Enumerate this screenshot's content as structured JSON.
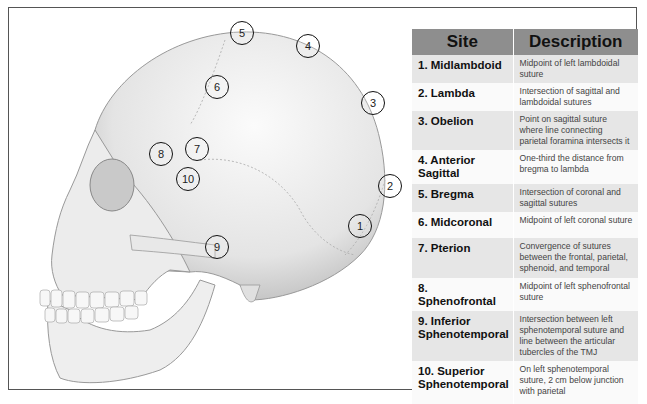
{
  "table": {
    "headers": {
      "site": "Site",
      "description": "Description"
    },
    "rows": [
      {
        "site": "1. Midlambdoid",
        "description": "Midpoint of left lambdoidal suture"
      },
      {
        "site": "2. Lambda",
        "description": "Intersection of sagittal and lambdoidal sutures"
      },
      {
        "site": "3. Obelion",
        "description": "Point on sagittal suture where line connecting parietal foramina intersects it"
      },
      {
        "site": "4. Anterior Sagittal",
        "description": "One-third the distance from bregma to lambda"
      },
      {
        "site": "5. Bregma",
        "description": "Intersection of coronal and sagittal sutures"
      },
      {
        "site": "6. Midcoronal",
        "description": "Midpoint of left coronal suture"
      },
      {
        "site": "7. Pterion",
        "description": "Convergence of sutures between the frontal, parietal, sphenoid, and temporal"
      },
      {
        "site": "8. Sphenofrontal",
        "description": "Midpoint of left sphenofrontal suture"
      },
      {
        "site": "9. Inferior Sphenotemporal",
        "description": "Intersection between left sphenotemporal suture and line between the articular tubercles of the TMJ"
      },
      {
        "site": "10. Superior Sphenotemporal",
        "description": "On left sphenotemporal suture, 2 cm below junction with parietal"
      }
    ]
  },
  "markers": [
    {
      "label": "1",
      "x": 348,
      "y": 214
    },
    {
      "label": "2",
      "x": 378,
      "y": 174
    },
    {
      "label": "3",
      "x": 361,
      "y": 91
    },
    {
      "label": "4",
      "x": 296,
      "y": 34
    },
    {
      "label": "5",
      "x": 230,
      "y": 21
    },
    {
      "label": "6",
      "x": 205,
      "y": 75
    },
    {
      "label": "7",
      "x": 185,
      "y": 137
    },
    {
      "label": "8",
      "x": 149,
      "y": 142
    },
    {
      "label": "9",
      "x": 205,
      "y": 235
    },
    {
      "label": "10",
      "x": 176,
      "y": 167
    }
  ],
  "colors": {
    "header_bg": "#8e8e8e",
    "row_odd": "#e6e6e6",
    "row_even": "#fafafa",
    "marker": "#111111"
  }
}
